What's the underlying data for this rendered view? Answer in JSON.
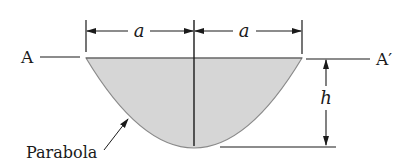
{
  "figure": {
    "labels": {
      "section_left": "A",
      "section_right": "A′",
      "half_width_left": "a",
      "half_width_right": "a",
      "height": "h",
      "curve_name": "Parabola"
    },
    "colors": {
      "fill": "#d6d6d6",
      "stroke": "#1a1a1a",
      "curve_stroke": "#8a8a8a"
    }
  }
}
